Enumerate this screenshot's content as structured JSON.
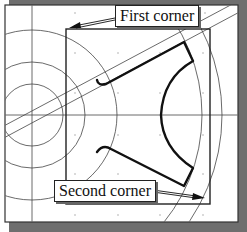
{
  "figure": {
    "type": "cad-window-selection-illustration",
    "colors": {
      "background": "#ffffff",
      "shadow": "#6e6e6e",
      "thin_line": "#444444",
      "thick_line": "#111111",
      "grid_dot": "#9a9a9a"
    }
  },
  "callouts": {
    "first_corner": {
      "label": "First corner"
    },
    "second_corner": {
      "label": "Second corner"
    }
  }
}
